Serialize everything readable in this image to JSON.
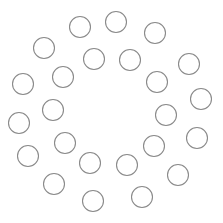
{
  "canvas": {
    "width": 223,
    "height": 223,
    "background": "#ffffff"
  },
  "style": {
    "stroke": "#8a8a8a",
    "stroke_width": 1.1,
    "fill": "none",
    "radius": 10.5
  },
  "circles": [
    {
      "cx": 80,
      "cy": 27
    },
    {
      "cx": 116,
      "cy": 22
    },
    {
      "cx": 155,
      "cy": 33
    },
    {
      "cx": 44,
      "cy": 48
    },
    {
      "cx": 94,
      "cy": 59
    },
    {
      "cx": 130,
      "cy": 60
    },
    {
      "cx": 189,
      "cy": 64
    },
    {
      "cx": 23,
      "cy": 84
    },
    {
      "cx": 63,
      "cy": 77
    },
    {
      "cx": 157,
      "cy": 82
    },
    {
      "cx": 201,
      "cy": 99
    },
    {
      "cx": 53,
      "cy": 110
    },
    {
      "cx": 166,
      "cy": 115
    },
    {
      "cx": 19,
      "cy": 123
    },
    {
      "cx": 65,
      "cy": 143
    },
    {
      "cx": 197,
      "cy": 138
    },
    {
      "cx": 154,
      "cy": 146
    },
    {
      "cx": 28,
      "cy": 156
    },
    {
      "cx": 90,
      "cy": 163
    },
    {
      "cx": 127,
      "cy": 165
    },
    {
      "cx": 178,
      "cy": 175
    },
    {
      "cx": 54,
      "cy": 184
    },
    {
      "cx": 93,
      "cy": 201
    },
    {
      "cx": 142,
      "cy": 197
    }
  ]
}
